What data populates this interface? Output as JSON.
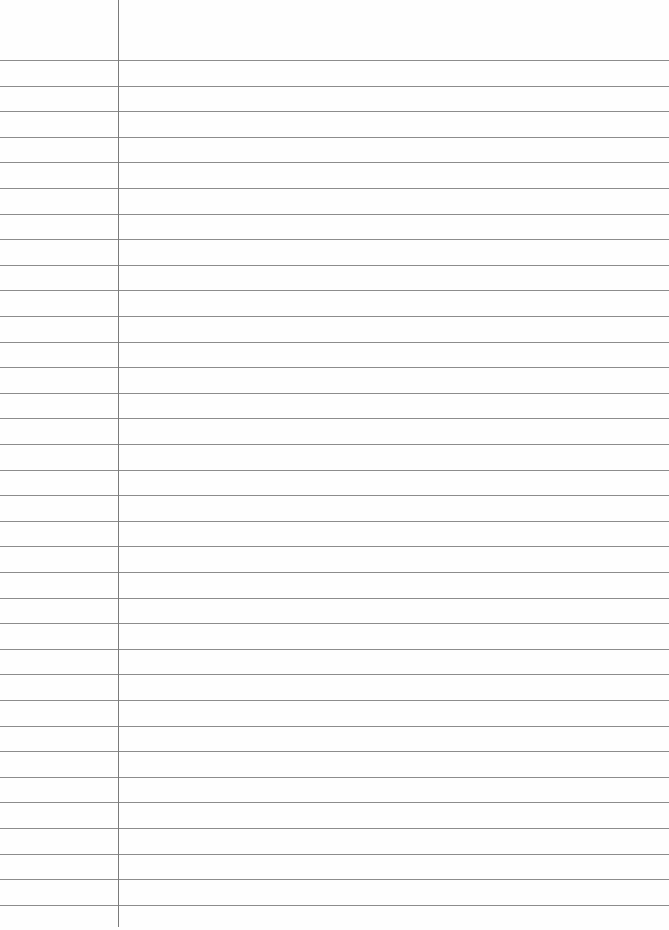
{
  "page": {
    "type": "lined-paper",
    "background": "#fefefe",
    "rule_color": "#8c8c8c",
    "margin_color": "#7a7a7a",
    "margin_x": 118,
    "first_line_y": 60,
    "line_spacing": 25.6,
    "line_count": 34
  }
}
